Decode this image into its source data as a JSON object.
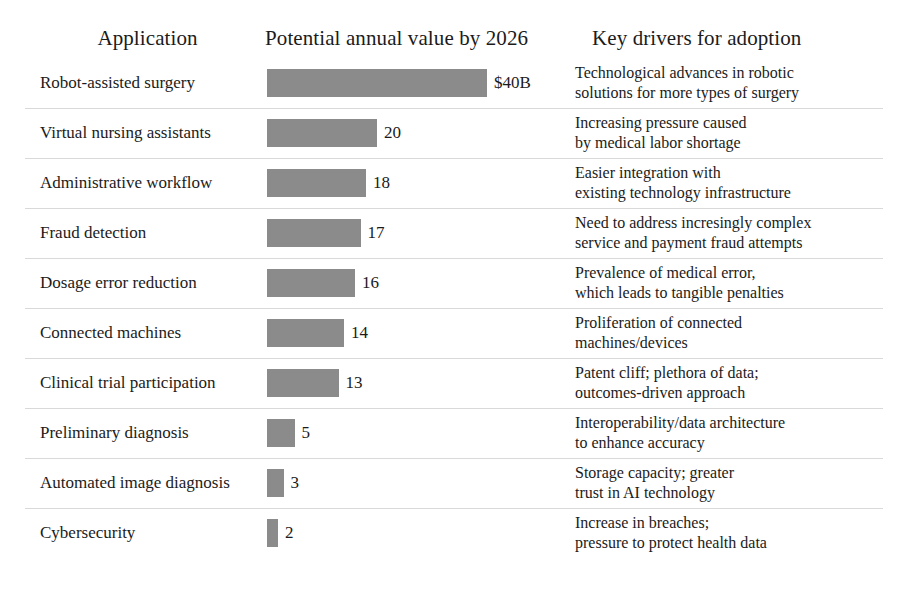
{
  "headers": {
    "application": "Application",
    "value": "Potential annual value by 2026",
    "drivers": "Key drivers for adoption"
  },
  "style": {
    "bar_color": "#8b8b8b",
    "divider_color": "#d9d9d9",
    "text_color": "#1b1b1b",
    "background": "#ffffff"
  },
  "chart_data": {
    "type": "bar",
    "title": "Potential annual value by 2026",
    "xlabel": "",
    "ylabel": "Application",
    "orientation": "horizontal",
    "units": "US$ billions",
    "grid": false,
    "legend": false,
    "xlim": [
      0,
      40
    ],
    "categories": [
      "Robot-assisted surgery",
      "Virtual nursing assistants",
      "Administrative workflow",
      "Fraud detection",
      "Dosage error reduction",
      "Connected machines",
      "Clinical trial participation",
      "Preliminary diagnosis",
      "Automated image diagnosis",
      "Cybersecurity"
    ],
    "values": [
      40,
      20,
      18,
      17,
      16,
      14,
      13,
      5,
      3,
      2
    ],
    "value_labels": [
      "$40B",
      "20",
      "18",
      "17",
      "16",
      "14",
      "13",
      "5",
      "3",
      "2"
    ],
    "annotations": [
      "Technological advances in robotic solutions for more types of surgery",
      "Increasing pressure caused by medical labor shortage",
      "Easier integration with existing technology infrastructure",
      "Need to address incresingly complex service and payment fraud attempts",
      "Prevalence of medical error, which leads to tangible penalties",
      "Proliferation of connected machines/devices",
      "Patent cliff; plethora of data; outcomes-driven approach",
      "Interoperability/data architecture to enhance accuracy",
      "Storage capacity; greater trust in AI technology",
      "Increase in breaches; pressure to protect health data"
    ]
  },
  "rows": [
    {
      "application": "Robot-assisted surgery",
      "value": 40,
      "value_label": "$40B",
      "driver_lines": [
        "Technological advances in robotic",
        "solutions for more types of surgery"
      ]
    },
    {
      "application": "Virtual nursing assistants",
      "value": 20,
      "value_label": "20",
      "driver_lines": [
        "Increasing pressure caused",
        "by medical labor shortage"
      ]
    },
    {
      "application": "Administrative workflow",
      "value": 18,
      "value_label": "18",
      "driver_lines": [
        "Easier integration with",
        "existing technology infrastructure"
      ]
    },
    {
      "application": "Fraud detection",
      "value": 17,
      "value_label": "17",
      "driver_lines": [
        "Need to address incresingly complex",
        "service and payment fraud attempts"
      ]
    },
    {
      "application": "Dosage error reduction",
      "value": 16,
      "value_label": "16",
      "driver_lines": [
        "Prevalence of medical error,",
        "which leads to tangible penalties"
      ]
    },
    {
      "application": "Connected machines",
      "value": 14,
      "value_label": "14",
      "driver_lines": [
        "Proliferation of connected",
        "machines/devices"
      ]
    },
    {
      "application": "Clinical trial participation",
      "value": 13,
      "value_label": "13",
      "driver_lines": [
        "Patent cliff; plethora of data;",
        "outcomes-driven approach"
      ]
    },
    {
      "application": "Preliminary diagnosis",
      "value": 5,
      "value_label": "5",
      "driver_lines": [
        "Interoperability/data architecture",
        "to enhance accuracy"
      ]
    },
    {
      "application": "Automated image diagnosis",
      "value": 3,
      "value_label": "3",
      "driver_lines": [
        "Storage capacity; greater",
        "trust in AI technology"
      ]
    },
    {
      "application": "Cybersecurity",
      "value": 2,
      "value_label": "2",
      "driver_lines": [
        "Increase in breaches;",
        "pressure to protect health data"
      ]
    }
  ]
}
